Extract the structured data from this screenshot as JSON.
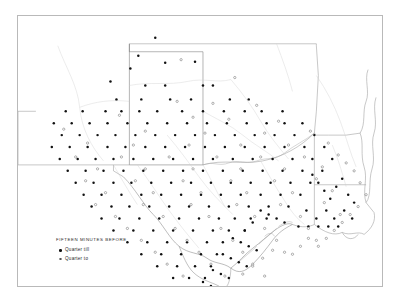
{
  "figure": {
    "frame_color": "#b9b9b9",
    "background": "#ffffff"
  },
  "legend": {
    "title": "FIFTEEN MINUTES BEFORE",
    "entries": [
      {
        "symbol": "filled-dot",
        "label": "Quarter till",
        "color": "#111111"
      },
      {
        "symbol": "open-circle",
        "label": "Quarter to",
        "color": "#555555"
      }
    ]
  },
  "chart_data": {
    "type": "scatter",
    "title": "FIFTEEN MINUTES BEFORE",
    "xlabel": "",
    "ylabel": "",
    "projection": "geographic-dot-map",
    "region": "Texas and adjacent states",
    "xlim": [
      0,
      366
    ],
    "ylim": [
      0,
      272
    ],
    "grid": false,
    "legend_position": "lower-left",
    "series": [
      {
        "name": "Quarter till",
        "marker": "filled-dot",
        "color": "#111111",
        "count": 214,
        "points": [
          [
            138,
            22
          ],
          [
            121,
            40
          ],
          [
            148,
            47
          ],
          [
            178,
            46
          ],
          [
            113,
            53
          ],
          [
            93,
            66
          ],
          [
            128,
            70
          ],
          [
            148,
            70
          ],
          [
            186,
            70
          ],
          [
            196,
            70
          ],
          [
            99,
            84
          ],
          [
            124,
            84
          ],
          [
            153,
            84
          ],
          [
            174,
            84
          ],
          [
            213,
            84
          ],
          [
            232,
            84
          ],
          [
            48,
            96
          ],
          [
            65,
            96
          ],
          [
            88,
            96
          ],
          [
            104,
            96
          ],
          [
            122,
            96
          ],
          [
            140,
            96
          ],
          [
            165,
            96
          ],
          [
            186,
            96
          ],
          [
            207,
            96
          ],
          [
            228,
            96
          ],
          [
            245,
            96
          ],
          [
            266,
            96
          ],
          [
            36,
            108
          ],
          [
            54,
            108
          ],
          [
            72,
            108
          ],
          [
            90,
            108
          ],
          [
            110,
            108
          ],
          [
            130,
            108
          ],
          [
            150,
            108
          ],
          [
            170,
            108
          ],
          [
            190,
            108
          ],
          [
            210,
            108
          ],
          [
            230,
            108
          ],
          [
            250,
            108
          ],
          [
            268,
            108
          ],
          [
            286,
            108
          ],
          [
            44,
            120
          ],
          [
            62,
            120
          ],
          [
            80,
            120
          ],
          [
            98,
            120
          ],
          [
            118,
            120
          ],
          [
            138,
            120
          ],
          [
            158,
            120
          ],
          [
            178,
            120
          ],
          [
            198,
            120
          ],
          [
            218,
            120
          ],
          [
            238,
            120
          ],
          [
            258,
            120
          ],
          [
            278,
            120
          ],
          [
            298,
            120
          ],
          [
            34,
            132
          ],
          [
            52,
            132
          ],
          [
            70,
            132
          ],
          [
            90,
            132
          ],
          [
            108,
            132
          ],
          [
            128,
            132
          ],
          [
            148,
            132
          ],
          [
            168,
            132
          ],
          [
            188,
            132
          ],
          [
            208,
            132
          ],
          [
            228,
            132
          ],
          [
            248,
            132
          ],
          [
            268,
            132
          ],
          [
            288,
            132
          ],
          [
            308,
            132
          ],
          [
            42,
            144
          ],
          [
            60,
            144
          ],
          [
            78,
            144
          ],
          [
            96,
            144
          ],
          [
            116,
            144
          ],
          [
            136,
            144
          ],
          [
            156,
            144
          ],
          [
            176,
            144
          ],
          [
            196,
            144
          ],
          [
            216,
            144
          ],
          [
            236,
            144
          ],
          [
            256,
            144
          ],
          [
            276,
            144
          ],
          [
            296,
            144
          ],
          [
            316,
            144
          ],
          [
            50,
            156
          ],
          [
            68,
            156
          ],
          [
            86,
            156
          ],
          [
            106,
            156
          ],
          [
            126,
            156
          ],
          [
            146,
            156
          ],
          [
            166,
            156
          ],
          [
            186,
            156
          ],
          [
            206,
            156
          ],
          [
            226,
            156
          ],
          [
            246,
            156
          ],
          [
            266,
            156
          ],
          [
            286,
            156
          ],
          [
            306,
            156
          ],
          [
            58,
            168
          ],
          [
            76,
            168
          ],
          [
            96,
            168
          ],
          [
            114,
            168
          ],
          [
            134,
            168
          ],
          [
            154,
            168
          ],
          [
            174,
            168
          ],
          [
            194,
            168
          ],
          [
            214,
            168
          ],
          [
            234,
            168
          ],
          [
            254,
            168
          ],
          [
            274,
            168
          ],
          [
            294,
            168
          ],
          [
            66,
            180
          ],
          [
            84,
            180
          ],
          [
            104,
            180
          ],
          [
            124,
            180
          ],
          [
            144,
            180
          ],
          [
            164,
            180
          ],
          [
            184,
            180
          ],
          [
            204,
            180
          ],
          [
            224,
            180
          ],
          [
            244,
            180
          ],
          [
            264,
            180
          ],
          [
            284,
            180
          ],
          [
            74,
            192
          ],
          [
            94,
            192
          ],
          [
            112,
            192
          ],
          [
            132,
            192
          ],
          [
            152,
            192
          ],
          [
            172,
            192
          ],
          [
            192,
            192
          ],
          [
            212,
            192
          ],
          [
            232,
            192
          ],
          [
            252,
            192
          ],
          [
            272,
            192
          ],
          [
            84,
            204
          ],
          [
            102,
            204
          ],
          [
            122,
            204
          ],
          [
            142,
            204
          ],
          [
            162,
            204
          ],
          [
            182,
            204
          ],
          [
            202,
            204
          ],
          [
            218,
            204
          ],
          [
            234,
            204
          ],
          [
            250,
            204
          ],
          [
            96,
            216
          ],
          [
            116,
            216
          ],
          [
            136,
            216
          ],
          [
            156,
            216
          ],
          [
            176,
            216
          ],
          [
            196,
            216
          ],
          [
            212,
            216
          ],
          [
            228,
            216
          ],
          [
            110,
            228
          ],
          [
            130,
            228
          ],
          [
            150,
            228
          ],
          [
            170,
            228
          ],
          [
            190,
            228
          ],
          [
            206,
            228
          ],
          [
            124,
            240
          ],
          [
            144,
            240
          ],
          [
            164,
            240
          ],
          [
            184,
            240
          ],
          [
            200,
            240
          ],
          [
            140,
            252
          ],
          [
            160,
            252
          ],
          [
            178,
            252
          ],
          [
            194,
            252
          ],
          [
            156,
            264
          ],
          [
            172,
            264
          ],
          [
            188,
            264
          ],
          [
            170,
            276
          ],
          [
            186,
            276
          ],
          [
            296,
            160
          ],
          [
            302,
            168
          ],
          [
            308,
            176
          ],
          [
            314,
            184
          ],
          [
            320,
            172
          ],
          [
            326,
            164
          ],
          [
            332,
            180
          ],
          [
            338,
            188
          ],
          [
            290,
            196
          ],
          [
            300,
            204
          ],
          [
            310,
            196
          ],
          [
            318,
            204
          ],
          [
            328,
            196
          ],
          [
            336,
            204
          ],
          [
            282,
            212
          ],
          [
            292,
            212
          ],
          [
            302,
            212
          ],
          [
            312,
            212
          ],
          [
            322,
            212
          ],
          [
            244,
            196
          ],
          [
            252,
            200
          ],
          [
            260,
            204
          ],
          [
            268,
            208
          ],
          [
            236,
            208
          ],
          [
            228,
            216
          ],
          [
            216,
            224
          ],
          [
            224,
            228
          ],
          [
            232,
            232
          ],
          [
            240,
            236
          ],
          [
            206,
            240
          ],
          [
            214,
            244
          ],
          [
            222,
            248
          ],
          [
            230,
            252
          ],
          [
            196,
            256
          ],
          [
            204,
            260
          ],
          [
            212,
            264
          ],
          [
            186,
            268
          ],
          [
            194,
            272
          ],
          [
            202,
            276
          ]
        ]
      },
      {
        "name": "Quarter to",
        "marker": "open-circle",
        "color": "#555555",
        "count": 96,
        "points": [
          [
            164,
            44
          ],
          [
            218,
            62
          ],
          [
            160,
            86
          ],
          [
            196,
            88
          ],
          [
            240,
            90
          ],
          [
            102,
            100
          ],
          [
            176,
            102
          ],
          [
            212,
            104
          ],
          [
            262,
            106
          ],
          [
            46,
            114
          ],
          [
            128,
            116
          ],
          [
            188,
            118
          ],
          [
            248,
            118
          ],
          [
            294,
            116
          ],
          [
            70,
            128
          ],
          [
            116,
            130
          ],
          [
            172,
            130
          ],
          [
            224,
            130
          ],
          [
            272,
            130
          ],
          [
            312,
            128
          ],
          [
            58,
            142
          ],
          [
            104,
            142
          ],
          [
            152,
            142
          ],
          [
            200,
            142
          ],
          [
            244,
            142
          ],
          [
            288,
            142
          ],
          [
            322,
            140
          ],
          [
            80,
            154
          ],
          [
            128,
            154
          ],
          [
            176,
            154
          ],
          [
            224,
            154
          ],
          [
            268,
            154
          ],
          [
            306,
            152
          ],
          [
            68,
            166
          ],
          [
            118,
            166
          ],
          [
            166,
            166
          ],
          [
            214,
            166
          ],
          [
            258,
            166
          ],
          [
            300,
            164
          ],
          [
            88,
            178
          ],
          [
            136,
            178
          ],
          [
            184,
            178
          ],
          [
            230,
            178
          ],
          [
            276,
            178
          ],
          [
            316,
            176
          ],
          [
            78,
            190
          ],
          [
            126,
            190
          ],
          [
            174,
            190
          ],
          [
            220,
            190
          ],
          [
            264,
            190
          ],
          [
            308,
            188
          ],
          [
            98,
            202
          ],
          [
            146,
            202
          ],
          [
            192,
            202
          ],
          [
            238,
            202
          ],
          [
            284,
            202
          ],
          [
            324,
            200
          ],
          [
            110,
            214
          ],
          [
            158,
            214
          ],
          [
            204,
            214
          ],
          [
            248,
            214
          ],
          [
            292,
            214
          ],
          [
            124,
            226
          ],
          [
            170,
            226
          ],
          [
            216,
            226
          ],
          [
            260,
            226
          ],
          [
            300,
            226
          ],
          [
            138,
            238
          ],
          [
            182,
            238
          ],
          [
            226,
            238
          ],
          [
            268,
            238
          ],
          [
            150,
            250
          ],
          [
            194,
            250
          ],
          [
            236,
            250
          ],
          [
            166,
            262
          ],
          [
            208,
            262
          ],
          [
            248,
            262
          ],
          [
            180,
            274
          ],
          [
            220,
            274
          ],
          [
            330,
            148
          ],
          [
            338,
            156
          ],
          [
            344,
            168
          ],
          [
            350,
            180
          ],
          [
            342,
            192
          ],
          [
            334,
            200
          ],
          [
            326,
            208
          ],
          [
            318,
            216
          ],
          [
            310,
            224
          ],
          [
            302,
            232
          ],
          [
            292,
            224
          ],
          [
            284,
            232
          ],
          [
            276,
            240
          ],
          [
            256,
            236
          ],
          [
            246,
            244
          ],
          [
            236,
            252
          ],
          [
            226,
            260
          ]
        ]
      }
    ],
    "annotations": []
  }
}
